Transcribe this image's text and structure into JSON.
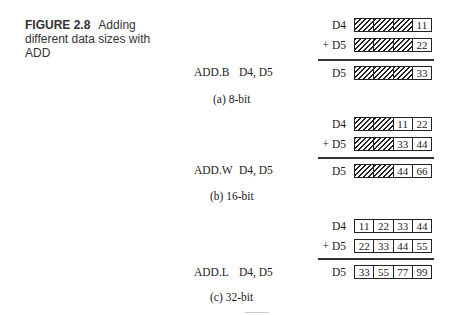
{
  "caption": {
    "figure_number": "FIGURE 2.8",
    "title": "Adding different data sizes with ADD"
  },
  "panels": [
    {
      "id": "a",
      "instruction_mnemonic": "ADD.B",
      "instruction_operands": "D4, D5",
      "subcaption": "(a) 8-bit",
      "rows": [
        {
          "label": "D4",
          "cells": [
            "",
            "",
            "",
            "11"
          ],
          "hatched": [
            true,
            true,
            true,
            false
          ]
        },
        {
          "label": "+ D5",
          "cells": [
            "",
            "",
            "",
            "22"
          ],
          "hatched": [
            true,
            true,
            true,
            false
          ]
        },
        {
          "label": "D5",
          "cells": [
            "",
            "",
            "",
            "33"
          ],
          "hatched": [
            true,
            true,
            true,
            false
          ]
        }
      ]
    },
    {
      "id": "b",
      "instruction_mnemonic": "ADD.W",
      "instruction_operands": "D4, D5",
      "subcaption": "(b) 16-bit",
      "rows": [
        {
          "label": "D4",
          "cells": [
            "",
            "",
            "11",
            "22"
          ],
          "hatched": [
            true,
            true,
            false,
            false
          ]
        },
        {
          "label": "+ D5",
          "cells": [
            "",
            "",
            "33",
            "44"
          ],
          "hatched": [
            true,
            true,
            false,
            false
          ]
        },
        {
          "label": "D5",
          "cells": [
            "",
            "",
            "44",
            "66"
          ],
          "hatched": [
            true,
            true,
            false,
            false
          ]
        }
      ]
    },
    {
      "id": "c",
      "instruction_mnemonic": "ADD.L",
      "instruction_operands": "D4, D5",
      "subcaption": "(c) 32-bit",
      "rows": [
        {
          "label": "D4",
          "cells": [
            "11",
            "22",
            "33",
            "44"
          ],
          "hatched": [
            false,
            false,
            false,
            false
          ]
        },
        {
          "label": "+ D5",
          "cells": [
            "22",
            "33",
            "44",
            "55"
          ],
          "hatched": [
            false,
            false,
            false,
            false
          ]
        },
        {
          "label": "D5",
          "cells": [
            "33",
            "55",
            "77",
            "99"
          ],
          "hatched": [
            false,
            false,
            false,
            false
          ]
        }
      ]
    }
  ],
  "colors": {
    "ink": "#222222",
    "caption_text": "#333333",
    "background": "#ffffff"
  }
}
